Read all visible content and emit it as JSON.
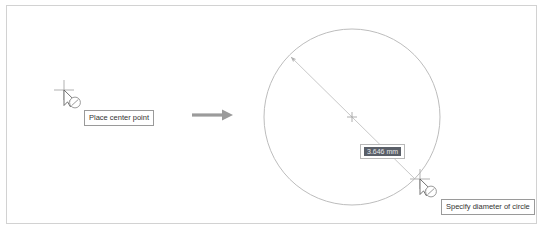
{
  "scene": {
    "description": "CAD circle creation step illustration",
    "background_color": "#ffffff",
    "frame_border_color": "#d2d2d2"
  },
  "left_step": {
    "cursor": {
      "icon": "crosshair-pointer-circle-cursor",
      "x": 64,
      "y": 92
    },
    "tooltip": {
      "label": "Place center point"
    }
  },
  "transition": {
    "icon": "right-arrow-icon",
    "color": "#9b9b9b"
  },
  "right_step": {
    "circle": {
      "center_x": 352,
      "center_y": 117,
      "radius": 88,
      "stroke_color": "#bdbdbd"
    },
    "center_mark": {
      "icon": "center-plus-mark"
    },
    "diameter_line": {
      "stroke_color": "#c2c2c2",
      "arrow_end": "upper-left"
    },
    "dimension": {
      "value": "3.646 mm",
      "highlight_color": "#5a5f68",
      "text_color": "#e8eaec"
    },
    "cursor": {
      "icon": "crosshair-pointer-circle-cursor",
      "x": 420,
      "y": 181
    },
    "tooltip": {
      "label": "Specify diameter of circle"
    }
  }
}
